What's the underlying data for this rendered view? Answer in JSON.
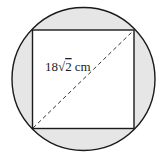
{
  "diagram": {
    "type": "square-inscribed-in-circle",
    "diagonal_label": "18√2 cm",
    "label_parts": {
      "coef": "18",
      "radical": "√",
      "radicand": "2",
      "unit": "cm"
    },
    "colors": {
      "shaded_region": "#e6e6e6",
      "square_fill": "#ffffff",
      "stroke": "#1a1a1a"
    }
  }
}
